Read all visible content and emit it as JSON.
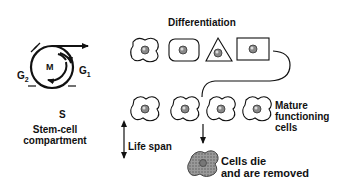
{
  "diagram": {
    "cycle": {
      "phases": {
        "m": "M",
        "g1": "G",
        "g1_sub": "1",
        "g2": "G",
        "g2_sub": "2",
        "s": "S"
      },
      "caption_line1": "Stem-cell",
      "caption_line2": "compartment"
    },
    "differentiation": {
      "title": "Differentiation",
      "cells": [
        "amoeboid",
        "rounded-square",
        "triangle",
        "rectangle"
      ]
    },
    "mature": {
      "label_line1": "Mature",
      "label_line2": "functioning",
      "label_line3": "cells",
      "count": 4
    },
    "lifespan": {
      "label": "Life span"
    },
    "death": {
      "label_line1": "Cells die",
      "label_line2": "and are removed"
    }
  }
}
